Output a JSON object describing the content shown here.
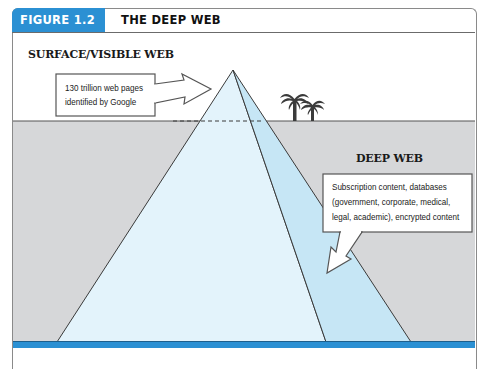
{
  "figure": {
    "number_label": "FIGURE 1.2",
    "title": "THE DEEP WEB",
    "accent_color": "#2b90d3"
  },
  "regions": {
    "surface": {
      "label": "SURFACE/VISIBLE WEB",
      "callout_line1": "130 trillion web pages",
      "callout_line2": "identified by Google"
    },
    "deep": {
      "label": "DEEP WEB",
      "callout_line1": "Subscription content, databases",
      "callout_line2": "(government, corporate, medical,",
      "callout_line3": "legal, academic), encrypted content"
    }
  },
  "icons": {
    "palm_trees": "palm-trees-icon",
    "pyramid": "iceberg-pyramid-icon"
  },
  "colors": {
    "sky": "#ffffff",
    "water": "#d6d7d9",
    "pyramid_front": "#e3f3fb",
    "pyramid_side": "#c6e6f5",
    "seabed": "#2b90d3",
    "outline": "#3a3a3a"
  }
}
